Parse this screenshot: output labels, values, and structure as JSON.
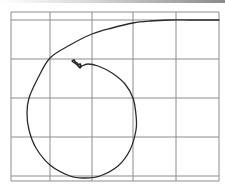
{
  "chart_data": {
    "type": "line",
    "title": "",
    "xlabel": "",
    "ylabel": "",
    "grid": true,
    "legend": null,
    "frame": {
      "left": 11,
      "right": 219,
      "top": 12,
      "bottom": 181
    },
    "grid_lines": {
      "x": [
        11,
        50,
        92,
        133,
        176,
        219
      ],
      "y": [
        12,
        20,
        59,
        98,
        137,
        176,
        181
      ]
    },
    "series": [
      {
        "name": "trajectory",
        "description": "inward spiral path starting flat at the top-right edge, sweeping left and down, looping around and ending in a small squiggle near the upper-left center",
        "points": [
          [
            219,
            20
          ],
          [
            190,
            20
          ],
          [
            170,
            20
          ],
          [
            150,
            21
          ],
          [
            133,
            23
          ],
          [
            112,
            28
          ],
          [
            92,
            34
          ],
          [
            70,
            45
          ],
          [
            50,
            58
          ],
          [
            38,
            78
          ],
          [
            29,
            98
          ],
          [
            27,
            113
          ],
          [
            29,
            130
          ],
          [
            36,
            148
          ],
          [
            50,
            165
          ],
          [
            70,
            176
          ],
          [
            85,
            178
          ],
          [
            100,
            176
          ],
          [
            118,
            166
          ],
          [
            130,
            150
          ],
          [
            136,
            130
          ],
          [
            136,
            115
          ],
          [
            133,
            98
          ],
          [
            125,
            84
          ],
          [
            112,
            73
          ],
          [
            98,
            66
          ],
          [
            88,
            64
          ],
          [
            82,
            66
          ],
          [
            80,
            68
          ],
          [
            78,
            66
          ],
          [
            76,
            64
          ],
          [
            73,
            62
          ],
          [
            72,
            61
          ]
        ]
      }
    ],
    "annotations": [
      {
        "type": "squiggle-end",
        "x": 76,
        "y": 64
      }
    ]
  },
  "colors": {
    "background": "#ffffff",
    "grid": "#8c8c8c",
    "frame": "#8c8c8c",
    "trajectory": "#2a2a2a"
  }
}
